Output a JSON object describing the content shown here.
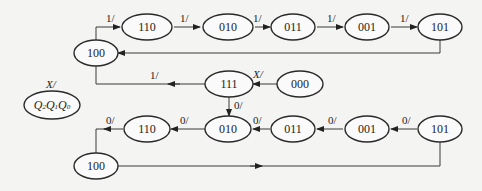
{
  "diagram": {
    "type": "state_transition_diagram",
    "legend": {
      "label": "X/",
      "state_format": "Q2Q1Q0"
    },
    "x_arrow_label": "X/",
    "top_sequence": {
      "nodes": [
        "100",
        "110",
        "010",
        "011",
        "001",
        "101"
      ],
      "labels": [
        "1/",
        "1/",
        "1/",
        "1/",
        "1/"
      ],
      "return_to": "100"
    },
    "middle": {
      "from_111_to_100_label": "1/",
      "from_000_to_111_label": "X/",
      "from_111_to_010_label": "0/",
      "nodes": [
        "111",
        "000"
      ]
    },
    "bottom_sequence": {
      "nodes": [
        "101",
        "001",
        "011",
        "010",
        "110",
        "100"
      ],
      "labels": [
        "0/",
        "0/",
        "0/",
        "0/",
        "0/"
      ],
      "return_to": "101"
    }
  }
}
